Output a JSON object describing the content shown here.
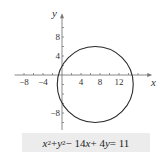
{
  "chart_data": {
    "type": "line",
    "title": "",
    "subtitle": "",
    "xlabel": "x",
    "ylabel": "y",
    "x_ticks": [
      -8,
      -4,
      4,
      8,
      12
    ],
    "y_ticks": [
      8,
      4,
      -8
    ],
    "x_tick_labels": [
      "−8",
      "−4",
      "4",
      "8",
      "12"
    ],
    "y_tick_labels": [
      "8",
      "4",
      "−8"
    ],
    "xlim": [
      -10,
      19
    ],
    "ylim": [
      -12,
      13
    ],
    "grid": false,
    "legend": null,
    "shape": "circle",
    "center": [
      7,
      -2
    ],
    "radius": 8,
    "equation": "x^2 + y^2 − 14x + 4y = 11"
  },
  "caption": {
    "parts": [
      "x",
      "2",
      " + ",
      "y",
      "2",
      " − 14",
      "x",
      " + 4",
      "y",
      " = 11"
    ]
  },
  "colors": {
    "curve": "#2a2a2a",
    "axes": "#6a6a6a",
    "caption_bg": "#ececec"
  }
}
